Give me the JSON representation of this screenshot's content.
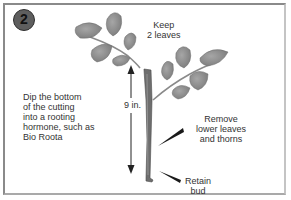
{
  "diagram": {
    "step_number": "2",
    "labels": {
      "keep_leaves": "Keep\n2 leaves",
      "dip_instruction": "Dip the bottom\nof the cutting\ninto a rooting\nhormone, such as\nBio Roota",
      "height_measure": "9 in.",
      "remove_leaves": "Remove\nlower leaves\nand thorns",
      "retain_bud": "Retain\nbud"
    },
    "icons": {
      "step_badge": "numbered-circle",
      "leaf": "rose-leaf",
      "stem": "rose-stem-cutting",
      "measure_arrow": "double-headed-arrow",
      "pointer": "wedge-pointer"
    },
    "colors": {
      "background": "#ffffff",
      "border": "#8a8a8a",
      "badge": "#5e5e5e",
      "leaf": "#8c8c8c",
      "stem": "#6e6e6e",
      "text": "#333333"
    }
  }
}
